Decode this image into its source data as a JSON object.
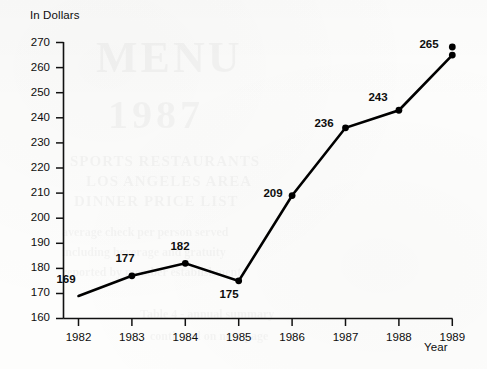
{
  "chart_data": {
    "type": "line",
    "title": "",
    "xlabel": "Year",
    "ylabel": "In Dollars",
    "categories": [
      "1982",
      "1983",
      "1984",
      "1985",
      "1986",
      "1987",
      "1988",
      "1989"
    ],
    "values": [
      169,
      177,
      182,
      175,
      209,
      236,
      243,
      265
    ],
    "point_labels": [
      "169",
      "177",
      "182",
      "175",
      "209",
      "236",
      "243",
      "265"
    ],
    "label_positions": [
      "above-left",
      "above-left",
      "above-left",
      "below-left",
      "above-left",
      "above-left",
      "above-left",
      "above-left"
    ],
    "ylim": [
      160,
      270
    ],
    "yticks": [
      160,
      170,
      180,
      190,
      200,
      210,
      220,
      230,
      240,
      250,
      260,
      270
    ],
    "ytick_labels": [
      "160",
      "170",
      "180",
      "190",
      "200",
      "210",
      "220",
      "230",
      "240",
      "250",
      "260",
      "270"
    ],
    "xtick_labels": [
      "1982",
      "1983",
      "1984",
      "1985",
      "1986",
      "1987",
      "1988",
      "1989"
    ],
    "grid": false,
    "legend": null,
    "series": [
      {
        "name": "In Dollars",
        "values": [
          169,
          177,
          182,
          175,
          209,
          236,
          243,
          265
        ],
        "color": "#000000",
        "marker": "filled-circle",
        "line_width": 2.6
      }
    ]
  },
  "colors": {
    "line": "#000000",
    "marker": "#000000",
    "axis": "#111111",
    "text": "#0d0d0d",
    "background": "#fdfdfc"
  },
  "axes": {
    "y_axis_title": "In Dollars",
    "x_axis_title": "Year"
  }
}
